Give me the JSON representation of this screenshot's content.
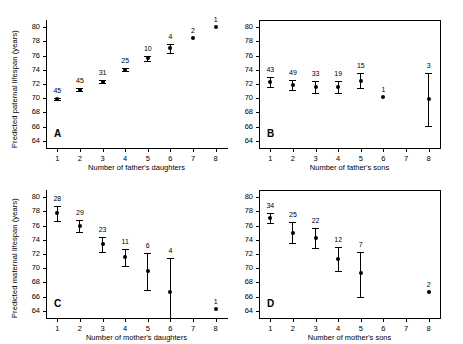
{
  "figure": {
    "panel_count": 4,
    "marker_color": "#000000",
    "axis_color": "#000000",
    "background": "#ffffff"
  },
  "chart_data": [
    {
      "type": "scatter",
      "panel": "A",
      "title": "",
      "xlabel": "Number of father's daughters",
      "ylabel": "Predicted paternal lifespan (years)",
      "x": [
        1,
        2,
        3,
        4,
        5,
        6,
        7,
        8
      ],
      "values": [
        69.9,
        71.2,
        72.3,
        74.0,
        75.6,
        77.0,
        78.5,
        80.0
      ],
      "err_low": [
        69.7,
        71.0,
        72.1,
        73.8,
        75.3,
        76.3,
        78.5,
        80.0
      ],
      "err_high": [
        70.1,
        71.4,
        72.5,
        74.2,
        75.9,
        77.6,
        78.5,
        80.0
      ],
      "point_labels": [
        "45",
        "45",
        "31",
        "25",
        "10",
        "4",
        "2",
        "1"
      ],
      "xlim": [
        0.5,
        8.5
      ],
      "ylim": [
        63,
        81
      ],
      "yticks": [
        64,
        66,
        68,
        70,
        72,
        74,
        76,
        78,
        80
      ],
      "xticks": [
        1,
        2,
        3,
        4,
        5,
        6,
        7,
        8
      ],
      "grid": false,
      "legend": "none"
    },
    {
      "type": "scatter",
      "panel": "B",
      "title": "",
      "xlabel": "Number of father's sons",
      "ylabel": "Predicted paternal lifespan (years)",
      "x": [
        1,
        2,
        3,
        4,
        5,
        6,
        8
      ],
      "values": [
        72.3,
        71.9,
        71.6,
        71.6,
        72.4,
        70.2,
        69.9
      ],
      "err_low": [
        71.6,
        71.2,
        70.8,
        70.8,
        71.4,
        70.2,
        66.1
      ],
      "err_high": [
        73.0,
        72.6,
        72.4,
        72.4,
        73.5,
        70.2,
        73.6
      ],
      "point_labels": [
        "43",
        "49",
        "33",
        "19",
        "15",
        "1",
        "3"
      ],
      "xlim": [
        0.5,
        8.5
      ],
      "ylim": [
        63,
        81
      ],
      "yticks": [
        64,
        66,
        68,
        70,
        72,
        74,
        76,
        78,
        80
      ],
      "xticks": [
        1,
        2,
        3,
        4,
        5,
        6,
        7,
        8
      ],
      "grid": false,
      "legend": "none"
    },
    {
      "type": "scatter",
      "panel": "C",
      "title": "",
      "xlabel": "Number of mother's daughters",
      "ylabel": "Predicted maternal lifespan (years)",
      "x": [
        1,
        2,
        3,
        4,
        5,
        6,
        8
      ],
      "values": [
        77.7,
        75.9,
        73.4,
        71.6,
        69.6,
        66.7,
        64.3
      ],
      "err_low": [
        76.7,
        75.1,
        72.3,
        70.3,
        66.9,
        62.8,
        64.3
      ],
      "err_high": [
        78.7,
        76.8,
        74.4,
        72.7,
        72.1,
        71.4,
        64.3
      ],
      "point_labels": [
        "28",
        "29",
        "23",
        "11",
        "6",
        "4",
        "1"
      ],
      "xlim": [
        0.5,
        8.5
      ],
      "ylim": [
        63,
        81
      ],
      "yticks": [
        64,
        66,
        68,
        70,
        72,
        74,
        76,
        78,
        80
      ],
      "xticks": [
        1,
        2,
        3,
        4,
        5,
        6,
        7,
        8
      ],
      "grid": false,
      "legend": "none"
    },
    {
      "type": "scatter",
      "panel": "D",
      "title": "",
      "xlabel": "Number of mother's sons",
      "ylabel": "Predicted maternal lifespan (years)",
      "x": [
        1,
        2,
        3,
        4,
        5,
        8
      ],
      "values": [
        77.0,
        75.0,
        74.2,
        71.3,
        69.3,
        66.7
      ],
      "err_low": [
        76.3,
        73.5,
        72.8,
        69.6,
        66.0,
        66.7
      ],
      "err_high": [
        77.8,
        76.5,
        75.6,
        73.0,
        72.3,
        66.7
      ],
      "point_labels": [
        "34",
        "25",
        "22",
        "12",
        "7",
        "2"
      ],
      "xlim": [
        0.5,
        8.5
      ],
      "ylim": [
        63,
        81
      ],
      "yticks": [
        64,
        66,
        68,
        70,
        72,
        74,
        76,
        78,
        80
      ],
      "xticks": [
        1,
        2,
        3,
        4,
        5,
        6,
        7,
        8
      ],
      "grid": false,
      "legend": "none"
    }
  ],
  "panels": {
    "A": {
      "letter": "A"
    },
    "B": {
      "letter": "B"
    },
    "C": {
      "letter": "C"
    },
    "D": {
      "letter": "D"
    }
  }
}
